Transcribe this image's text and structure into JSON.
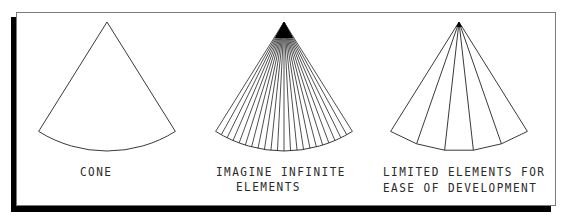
{
  "figure": {
    "frame": {
      "border_color": "#7a7a7a",
      "shadow_color": "#000000",
      "background": "#ffffff"
    },
    "panels": [
      {
        "id": "cone",
        "label_lines": [
          "CONE"
        ],
        "apex": [
          107,
          22
        ],
        "radius": 129,
        "half_angle_deg": 32,
        "elements": 1,
        "style": "arc"
      },
      {
        "id": "infinite",
        "label_lines": [
          "IMAGINE INFINITE",
          "ELEMENTS"
        ],
        "apex": [
          284,
          22
        ],
        "radius": 129,
        "half_angle_deg": 32,
        "elements": 22,
        "style": "arc"
      },
      {
        "id": "limited",
        "label_lines": [
          "LIMITED ELEMENTS FOR",
          "EASE OF DEVELOPMENT"
        ],
        "apex": [
          459,
          22
        ],
        "radius": 129,
        "half_angle_deg": 32,
        "elements": 5,
        "style": "chord"
      }
    ]
  }
}
